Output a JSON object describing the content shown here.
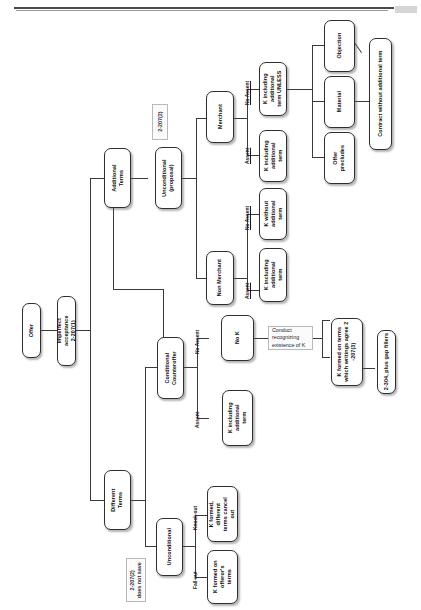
{
  "document": {
    "title": "UCC 2-207 Battle of the Forms Flowchart",
    "orientation": "rotated-90-ccw"
  },
  "nodes": {
    "offer": "Offer",
    "imperfect_acceptance": "Imperfect\nacceptance\n2-207(1)",
    "additional_terms": "Additional\nTerms",
    "different_terms": "Different\nTerms",
    "unconditional_proposal": "Unconditional\n(proposal)",
    "conditional_counteroffer": "Conditional\nCounteroffer",
    "unconditional_diff": "Unconditional",
    "merchant": "Merchant",
    "non_merchant": "Non Merchant",
    "k_incl_add_term_merchant_assent": "K including\nadditional\nterm",
    "k_incl_add_term_unless": "K including\nadditional\nterm UNLESS",
    "k_incl_add_term_nonmerch_assent": "K including\nadditional\nterm",
    "k_without_add_term": "K without\nadditional\nterm",
    "objection": "Objection",
    "material": "Material",
    "offer_precludes": "Offer\nprecludes",
    "contract_without_add_term": "Contract without additional term",
    "no_k": "No K",
    "k_incl_add_term_cc_assent": "K including\nadditional\nterm",
    "k_formed_writings_agree": "K formed on terms\nwhich writings agree 2\n-207(3)",
    "gap_fillers": "2-304, plus gap fillers",
    "k_formed_diff_cancel": "K formed,\ndifferent\nterms cancel\nout",
    "k_formed_offerors_terms": "K formed on\nofferor's\nterms"
  },
  "notes": {
    "note_2_207_2": "2-207(2)",
    "note_does_not_save": "2-207(2)\ndoes not save",
    "note_conduct": "Conduct\nrecognizing\nexistence of K"
  },
  "edge_labels": {
    "merchant_no_assent": "No Assent",
    "merchant_assent": "Assent",
    "nonmerchant_no_assent": "No Assent",
    "nonmerchant_assent": "Assent",
    "cc_no_assent": "No Assent",
    "cc_assent": "Assent",
    "knock_out": "Knock-out",
    "fall_out": "Fall-out"
  },
  "colors": {
    "node_border": "#2f2f2f",
    "line": "#3a3a3a",
    "note_border": "#b9b9b9",
    "page_background": "#ffffff",
    "rule": "#4a4a4a"
  }
}
